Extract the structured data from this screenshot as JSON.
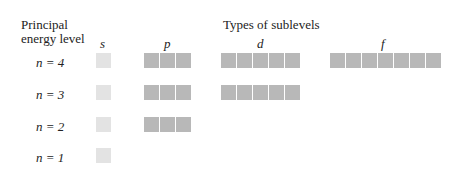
{
  "header": {
    "principal_line1": "Principal",
    "principal_line2": "energy level",
    "sublevels_title": "Types of sublevels"
  },
  "sublevel_labels": {
    "s": "s",
    "p": "p",
    "d": "d",
    "f": "f"
  },
  "rows": [
    {
      "label": "n = 4",
      "sublevels": [
        "s",
        "p",
        "d",
        "f"
      ]
    },
    {
      "label": "n = 3",
      "sublevels": [
        "s",
        "p",
        "d"
      ]
    },
    {
      "label": "n = 2",
      "sublevels": [
        "s",
        "p"
      ]
    },
    {
      "label": "n = 1",
      "sublevels": [
        "s"
      ]
    }
  ],
  "orbital_counts": {
    "s": 1,
    "p": 3,
    "d": 5,
    "f": 7
  },
  "colors": {
    "s_box": "#e3e3e3",
    "pdf_box": "#b8b8b8"
  }
}
